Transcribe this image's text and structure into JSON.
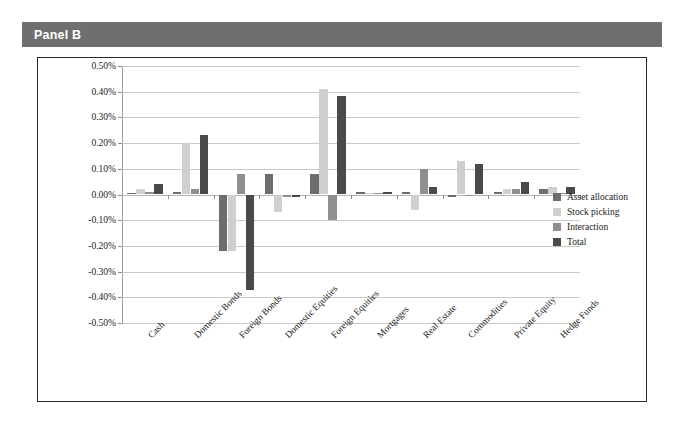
{
  "panel": {
    "title": "Panel B"
  },
  "legend": {
    "position": "right",
    "items": [
      {
        "label": "Asset allocation",
        "color": "#6d6d6d"
      },
      {
        "label": "Stock picking",
        "color": "#cfcfcf"
      },
      {
        "label": "Interaction",
        "color": "#8f8f8f"
      },
      {
        "label": "Total",
        "color": "#4a4a4a"
      }
    ]
  },
  "chart_data": {
    "type": "bar",
    "title": "Panel B",
    "xlabel": "",
    "ylabel": "",
    "ylim": [
      -0.5,
      0.5
    ],
    "ytick_step": 0.1,
    "ytick_labels": [
      "0.50%",
      "0.40%",
      "0.30%",
      "0.20%",
      "0.10%",
      "0.00%",
      "-0.10%",
      "-0.20%",
      "-0.30%",
      "-0.40%",
      "-0.50%"
    ],
    "ytick_values": [
      0.5,
      0.4,
      0.3,
      0.2,
      0.1,
      0.0,
      -0.1,
      -0.2,
      -0.3,
      -0.4,
      -0.5
    ],
    "grid": true,
    "value_unit": "percent",
    "categories": [
      "Cash",
      "Domestic Bonds",
      "Foreign Bonds",
      "Domestic Equities",
      "Foreign Equities",
      "Mortgages",
      "Real Estate",
      "Commodities",
      "Private Equity",
      "Hedge Funds"
    ],
    "series": [
      {
        "name": "Asset allocation",
        "color": "#6d6d6d",
        "values": [
          0.005,
          0.01,
          -0.22,
          0.08,
          0.08,
          0.01,
          0.01,
          -0.01,
          0.01,
          0.02
        ]
      },
      {
        "name": "Stock picking",
        "color": "#cfcfcf",
        "values": [
          0.02,
          0.2,
          -0.22,
          -0.07,
          0.41,
          0.005,
          -0.06,
          0.13,
          0.02,
          0.03
        ]
      },
      {
        "name": "Interaction",
        "color": "#8f8f8f",
        "values": [
          0.01,
          0.02,
          0.08,
          -0.01,
          -0.1,
          0.005,
          0.1,
          0.0,
          0.02,
          0.005
        ]
      },
      {
        "name": "Total",
        "color": "#4a4a4a",
        "values": [
          0.04,
          0.23,
          -0.37,
          -0.01,
          0.385,
          0.01,
          0.03,
          0.12,
          0.05,
          0.03
        ]
      }
    ]
  }
}
